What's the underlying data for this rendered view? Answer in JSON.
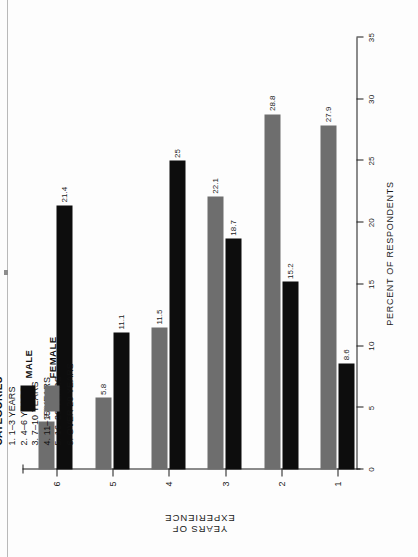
{
  "chart_data": {
    "type": "bar",
    "orientation": "vertical",
    "title": "",
    "xlabel": "YEARS OF EXPERIENCE",
    "ylabel": "PERCENT OF RESPONDENTS",
    "categories": [
      "1",
      "2",
      "3",
      "4",
      "5",
      "6"
    ],
    "ylim": [
      0,
      35
    ],
    "yticks": [
      "0",
      "5",
      "10",
      "15",
      "20",
      "25",
      "30",
      "35"
    ],
    "grid": false,
    "legend_position": "top-right",
    "series": [
      {
        "name": "MALE",
        "color": "#0d0d0d",
        "values": [
          8.6,
          15.2,
          18.7,
          25,
          11.1,
          21.4
        ],
        "labels": [
          "8.6",
          "15.2",
          "18.7",
          "25",
          "11.1",
          "21.4"
        ]
      },
      {
        "name": "FEMALE",
        "color": "#6e6e6e",
        "values": [
          27.9,
          28.8,
          22.1,
          11.5,
          5.8,
          3.9
        ],
        "labels": [
          "27.9",
          "28.8",
          "22.1",
          "11.5",
          "5.8",
          "3.9"
        ]
      }
    ]
  },
  "legend": {
    "categories_heading": "CATEGORIES",
    "category_lines": [
      "1. 1–3 YEARS",
      "2. 4–6 YEARS",
      "3. 7–10 YEARS",
      "4. 11–15 YEARS",
      "5. 16–20 YEARS",
      "6. OVER 20 YEARS"
    ],
    "keys": [
      {
        "label": "MALE",
        "color": "#0d0d0d"
      },
      {
        "label": "FEMALE",
        "color": "#6e6e6e"
      }
    ]
  },
  "axes": {
    "value_axis_title": "PERCENT OF RESPONDENTS",
    "category_axis_title": "YEARS OF EXPERIENCE"
  }
}
